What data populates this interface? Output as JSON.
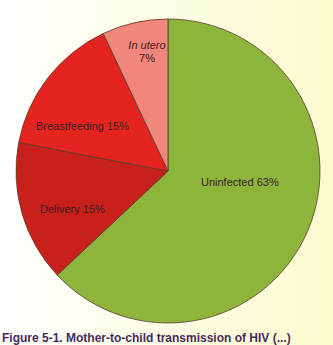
{
  "chart_data": {
    "type": "pie",
    "title": "",
    "start_angle_deg": 0,
    "direction": "counterclockwise-from-top for small slices; Uninfected fills clockwise from top",
    "slices": [
      {
        "label": "Uninfected",
        "value": 63,
        "display": "Uninfected 63%",
        "color": "#8db53c"
      },
      {
        "label": "Delivery",
        "value": 15,
        "display": "Delivery 15%",
        "color": "#c8201c"
      },
      {
        "label": "Breastfeeding",
        "value": 15,
        "display": "Breastfeeding 15%",
        "color": "#e52420"
      },
      {
        "label": "In utero",
        "value": 7,
        "display": "7%",
        "color": "#f0877a"
      }
    ],
    "categories": [
      "Uninfected",
      "Delivery",
      "Breastfeeding",
      "In utero"
    ],
    "values": [
      63,
      15,
      15,
      7
    ],
    "units": "%",
    "legend": "none (labels inside slices)"
  },
  "labels": {
    "uninfected": "Uninfected 63%",
    "delivery": "Delivery 15%",
    "breastfeeding": "Breastfeeding 15%",
    "in_utero_name": "In utero",
    "in_utero_value": "7%"
  },
  "caption": "Figure 5-1. Mother-to-child transmission of HIV (...)",
  "colors": {
    "uninfected": "#8db53c",
    "delivery": "#c8201c",
    "breastfeeding": "#e52420",
    "in_utero": "#f0877a",
    "outline": "#5a3a2a"
  }
}
